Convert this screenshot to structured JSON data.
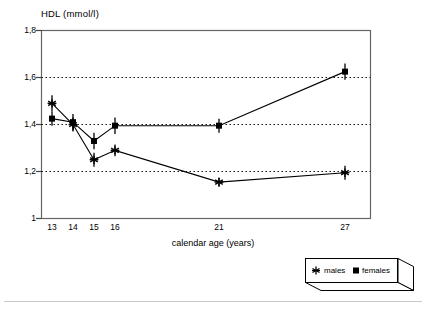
{
  "chart_data": {
    "type": "line",
    "title": "",
    "ylabel": "HDL (mmol/l)",
    "xlabel": "calendar age (years)",
    "categories": [
      "13",
      "14",
      "15",
      "16",
      "21",
      "27"
    ],
    "x": [
      13,
      14,
      15,
      16,
      21,
      27
    ],
    "ylim": [
      1,
      1.8
    ],
    "yticks": [
      "1",
      "1,2",
      "1,4",
      "1,6",
      "1,8"
    ],
    "ytick_values": [
      1,
      1.2,
      1.4,
      1.6,
      1.8
    ],
    "xticks": [
      "13",
      "14",
      "15",
      "16",
      "21",
      "27"
    ],
    "grid": "horizontal dotted at 1,2 / 1,4 / 1,6",
    "legend_position": "bottom-right outside",
    "series": [
      {
        "name": "males",
        "marker": "asterisk",
        "values": [
          1.49,
          1.4,
          1.25,
          1.29,
          1.155,
          1.195
        ],
        "errors": [
          0.035,
          0.03,
          0.03,
          0.025,
          0.02,
          0.03
        ]
      },
      {
        "name": "females",
        "marker": "square",
        "values": [
          1.425,
          1.41,
          1.33,
          1.395,
          1.395,
          1.625
        ],
        "errors": [
          0.03,
          0.035,
          0.035,
          0.035,
          0.03,
          0.035
        ]
      }
    ]
  },
  "axis": {
    "y_title": "HDL (mmol/l)",
    "x_title": "calendar age (years)"
  },
  "legend": {
    "males_marker": "asterisk-marker-icon",
    "males_label": "males",
    "females_marker": "square-marker-icon",
    "females_label": "females",
    "combined": "males   females"
  },
  "colors": {
    "ink": "#000000",
    "axis": "#555555",
    "grid": "#000000",
    "rule": "#c9c9c9",
    "background": "#ffffff"
  }
}
